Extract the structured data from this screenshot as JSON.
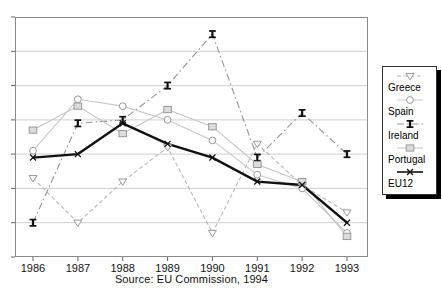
{
  "window": {
    "background": "#ffffff"
  },
  "chart_data": {
    "type": "line",
    "title": "",
    "caption": "Source: EU Commission, 1994",
    "categories": [
      "1986",
      "1987",
      "1988",
      "1989",
      "1990",
      "1991",
      "1992",
      "1993"
    ],
    "xlabel": "",
    "ylabel": "",
    "ylim": [
      0,
      7
    ],
    "y_gridline_interval": 1,
    "y_axis_labels_visible": false,
    "grid": true,
    "legend_position": "right",
    "colors": {
      "gridline": "#c9c9c9",
      "plot_border": "#8a8a8a",
      "light_series": "#c4c4c4",
      "dark_series": "#111111"
    },
    "series": [
      {
        "name": "Greece",
        "marker": "triangle-down",
        "line_style": "dashed",
        "color": "#b8b8b8",
        "values": [
          2.3,
          1.0,
          2.2,
          3.2,
          0.7,
          3.3,
          2.1,
          1.3
        ]
      },
      {
        "name": "Spain",
        "marker": "circle",
        "line_style": "solid",
        "color": "#c9c9c9",
        "values": [
          3.1,
          4.6,
          4.4,
          4.0,
          3.4,
          2.4,
          2.0,
          0.7
        ]
      },
      {
        "name": "Ireland",
        "marker": "bowtie",
        "line_style": "dash-dot",
        "color": "#959595",
        "marker_color": "#111111",
        "values": [
          1.0,
          3.9,
          4.0,
          5.0,
          6.5,
          2.9,
          4.2,
          3.0
        ]
      },
      {
        "name": "Portugal",
        "marker": "square",
        "line_style": "solid",
        "color": "#c4c4c4",
        "marker_fill": "#dcdcdc",
        "values": [
          3.7,
          4.4,
          3.6,
          4.3,
          3.8,
          2.7,
          2.2,
          0.6
        ]
      },
      {
        "name": "EU12",
        "marker": "x-cross",
        "line_style": "solid",
        "color": "#111111",
        "line_width": 2.4,
        "values": [
          2.9,
          3.0,
          3.9,
          3.3,
          2.9,
          2.2,
          2.1,
          1.0
        ]
      }
    ]
  }
}
